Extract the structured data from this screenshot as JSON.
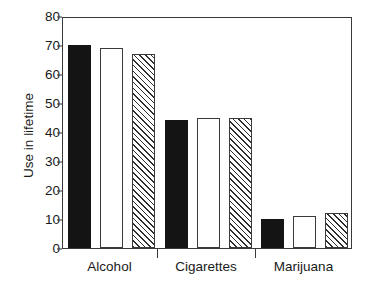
{
  "chart_data": {
    "type": "bar",
    "title": "",
    "xlabel": "",
    "ylabel": "Use in lifetime",
    "categories": [
      "Alcohol",
      "Cigarettes",
      "Marijuana"
    ],
    "series": [
      {
        "name": "series-1-solid",
        "style": "solid-black",
        "values": [
          70,
          44,
          10
        ]
      },
      {
        "name": "series-2-open",
        "style": "open-white",
        "values": [
          69,
          45,
          11
        ]
      },
      {
        "name": "series-3-hatch",
        "style": "diagonal-hatch",
        "values": [
          67,
          45,
          12
        ]
      }
    ],
    "ylim": [
      0,
      80
    ],
    "ytick_values": [
      0,
      10,
      20,
      30,
      40,
      50,
      60,
      70,
      80
    ],
    "ytick_labels": [
      "0",
      "10",
      "20",
      "30",
      "40",
      "50",
      "60",
      "70",
      "80"
    ],
    "grid": false,
    "legend": "none",
    "frame": "box",
    "colors": {
      "solid": "#141414",
      "open_fill": "#ffffff",
      "outline": "#3a3a3a",
      "hatch_line": "#2e2e2e",
      "background": "#ffffff",
      "text": "#1a1a1a"
    }
  }
}
